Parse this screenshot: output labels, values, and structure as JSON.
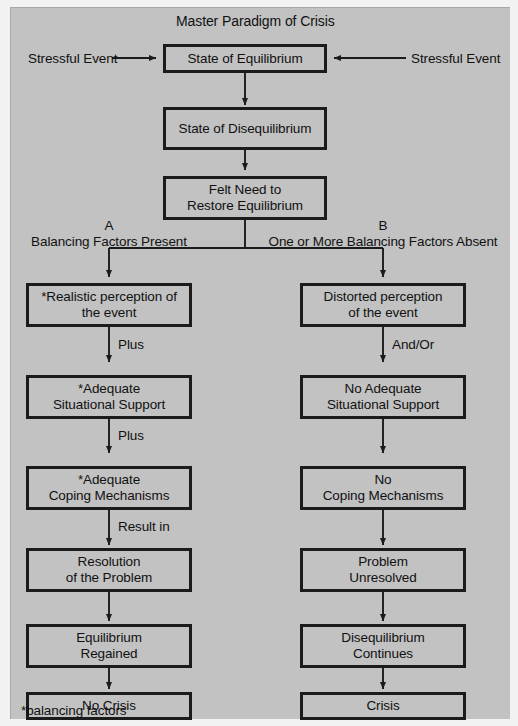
{
  "figure": {
    "title": "Master Paradigm of Crisis",
    "footnote": "*balancing factors",
    "panel_color": "#c2c2c2",
    "line_color": "#1b1b1b",
    "page_color": "#f2f2f2"
  },
  "inputs": {
    "left_event": "Stressful Event",
    "right_event": "Stressful Event"
  },
  "trunk": [
    {
      "id": "equilibrium",
      "text": "State of Equilibrium"
    },
    {
      "id": "disequilibrium",
      "text": "State of Disequilibrium"
    },
    {
      "id": "felt-need",
      "text": "Felt Need to\nRestore Equilibrium"
    }
  ],
  "branches": {
    "a": {
      "letter": "A",
      "caption": "Balancing Factors Present"
    },
    "b": {
      "letter": "B",
      "caption": "One or More Balancing Factors Absent"
    }
  },
  "column_a": {
    "nodes": [
      {
        "id": "a1",
        "text": "*Realistic perception of\nthe event"
      },
      {
        "id": "a2",
        "text": "*Adequate\nSituational Support"
      },
      {
        "id": "a3",
        "text": "*Adequate\nCoping Mechanisms"
      },
      {
        "id": "a4",
        "text": "Resolution\nof the Problem"
      },
      {
        "id": "a5",
        "text": "Equilibrium\nRegained"
      },
      {
        "id": "a6",
        "text": "No Crisis"
      }
    ],
    "connectors": [
      "Plus",
      "Plus",
      "Result in",
      "",
      "",
      ""
    ]
  },
  "column_b": {
    "nodes": [
      {
        "id": "b1",
        "text": "Distorted perception\nof the event"
      },
      {
        "id": "b2",
        "text": "No Adequate\nSituational Support"
      },
      {
        "id": "b3",
        "text": "No\nCoping Mechanisms"
      },
      {
        "id": "b4",
        "text": "Problem\nUnresolved"
      },
      {
        "id": "b5",
        "text": "Disequilibrium\nContinues"
      },
      {
        "id": "b6",
        "text": "Crisis"
      }
    ],
    "connectors": [
      "And/Or",
      "",
      "",
      "",
      "",
      ""
    ]
  }
}
